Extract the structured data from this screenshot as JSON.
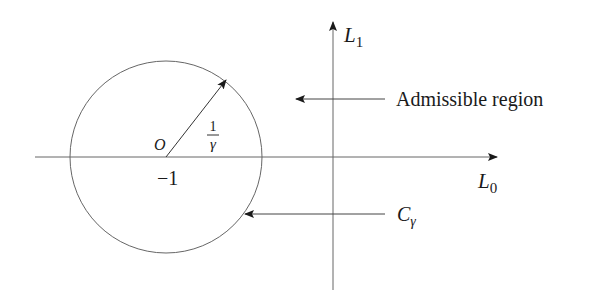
{
  "diagram": {
    "type": "complex-plane stability region",
    "axes": {
      "horizontal_label": "L",
      "horizontal_sub": "0",
      "vertical_label": "L",
      "vertical_sub": "1"
    },
    "circle": {
      "center_label": "O",
      "center_value": "−1",
      "radius_num": "1",
      "radius_den": "γ",
      "name": "C",
      "name_sub": "γ"
    },
    "annotations": {
      "admissible": "Admissible region"
    },
    "colors": {
      "line": "#555555",
      "text": "#1a1a1a"
    }
  }
}
